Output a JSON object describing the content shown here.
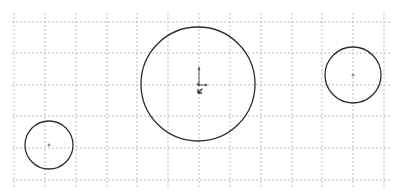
{
  "canvas": {
    "width": 395,
    "height": 194,
    "background": "#ffffff"
  },
  "grid": {
    "color": "#bdbdbd",
    "vertical_x": [
      14,
      45,
      76,
      107,
      137,
      168,
      199,
      230,
      261,
      292,
      322,
      353,
      384
    ],
    "horizontal_y": [
      22,
      53,
      85,
      116,
      148,
      180
    ],
    "x_extent": [
      12,
      390
    ],
    "y_extent": [
      13,
      189
    ]
  },
  "shapes": [
    {
      "id": "circle-large",
      "type": "circle",
      "cx": 198,
      "cy": 84,
      "r": 57,
      "stroke": "#2e2e2e"
    },
    {
      "id": "circle-right",
      "type": "circle",
      "cx": 353,
      "cy": 75,
      "r": 28,
      "stroke": "#2e2e2e"
    },
    {
      "id": "circle-small",
      "type": "circle",
      "cx": 49,
      "cy": 145,
      "r": 24,
      "stroke": "#2e2e2e"
    }
  ],
  "origin": {
    "x": 199,
    "y": 85,
    "y_axis_length": 18,
    "x_axis_length": 8,
    "color": "#555555"
  },
  "cursor": {
    "x": 198,
    "y": 93,
    "icon": "arrow-cursor-icon"
  }
}
